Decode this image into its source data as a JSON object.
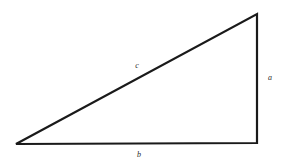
{
  "figure": {
    "name": "right-triangle-diagram",
    "type": "geometric-diagram",
    "width": 284,
    "height": 164,
    "background_color": "#ffffff",
    "stroke_color": "#1a1a1a",
    "stroke_width": 2.2,
    "label_color": "#2b2b2b"
  },
  "vertices": {
    "bottom_left": {
      "x": 16,
      "y": 144
    },
    "bottom_right": {
      "x": 257,
      "y": 143
    },
    "top_right": {
      "x": 257,
      "y": 14
    }
  },
  "sides": [
    {
      "id": "hypotenuse",
      "label": "c",
      "label_x": 137,
      "label_y": 66,
      "from": "bottom_left",
      "to": "top_right"
    },
    {
      "id": "vertical-leg",
      "label": "a",
      "label_x": 270,
      "label_y": 78,
      "from": "top_right",
      "to": "bottom_right"
    },
    {
      "id": "horizontal-leg",
      "label": "b",
      "label_x": 139,
      "label_y": 155,
      "from": "bottom_left",
      "to": "bottom_right"
    }
  ],
  "path": {
    "outline": "M 16 144 L 257 14 L 257 143 Z"
  }
}
